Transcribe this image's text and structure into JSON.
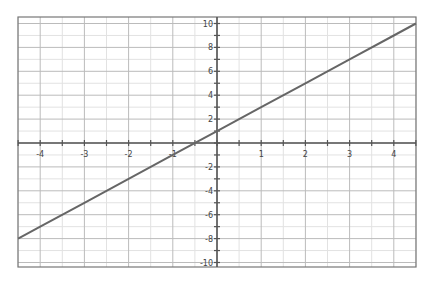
{
  "chart_data": {
    "type": "line",
    "title": "",
    "xlabel": "",
    "ylabel": "",
    "function": "y = 2x + 1",
    "xlim": [
      -4.5,
      4.5
    ],
    "ylim": [
      -10.5,
      10.5
    ],
    "grid": true,
    "x_ticks": [
      -4,
      -3,
      -2,
      -1,
      1,
      2,
      3,
      4
    ],
    "y_ticks": [
      -10,
      -8,
      -6,
      -4,
      -2,
      2,
      4,
      6,
      8,
      10
    ],
    "series": [
      {
        "name": "y = 2x + 1",
        "x": [
          -4.5,
          -4,
          -3,
          -2,
          -1,
          0,
          1,
          2,
          3,
          4,
          4.5
        ],
        "y": [
          -8,
          -7,
          -5,
          -3,
          -1,
          1,
          3,
          5,
          7,
          9,
          10
        ],
        "color": "#666666"
      }
    ]
  },
  "style": {
    "line_color": "#666666",
    "axis_color": "#555555",
    "grid_major_color": "#bbbbbb",
    "grid_minor_color": "#e2e2e2",
    "frame_color": "#777777"
  }
}
